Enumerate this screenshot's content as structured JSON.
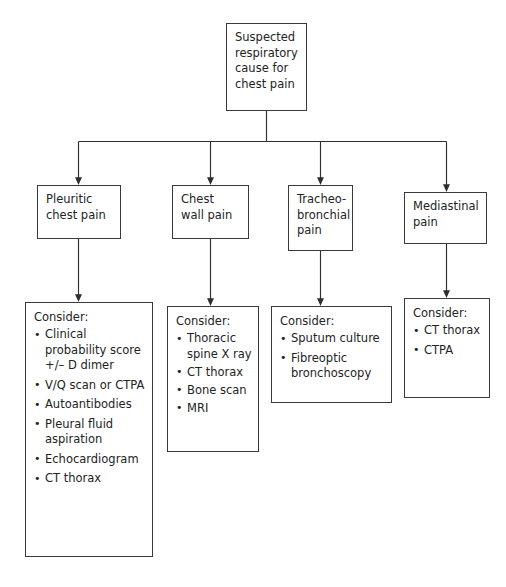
{
  "diagram": {
    "line_color": "#3a3a3a",
    "box_fill": "#ffffff",
    "text_color": "#232323"
  },
  "root": {
    "label": "Suspected\nrespiratory\ncause for\nchest pain"
  },
  "branches": [
    {
      "label": "Pleuritic\nchest pain"
    },
    {
      "label": "Chest\nwall pain"
    },
    {
      "label": "Tracheo-\nbronchial\npain"
    },
    {
      "label": "Mediastinal\npain"
    }
  ],
  "consider_boxes": [
    {
      "header": "Consider:",
      "items": [
        "Clinical\nprobability score\n+/– D dimer",
        "V/Q scan or\nCTPA",
        "Autoantibodies",
        "Pleural fluid\naspiration",
        "Echocardiogram",
        "CT thorax"
      ]
    },
    {
      "header": "Consider:",
      "items": [
        "Thoracic\nspine X ray",
        "CT thorax",
        "Bone scan",
        "MRI"
      ]
    },
    {
      "header": "Consider:",
      "items": [
        "Sputum culture",
        "Fibreoptic\nbronchoscopy"
      ]
    },
    {
      "header": "Consider:",
      "items": [
        "CT thorax",
        "CTPA"
      ]
    }
  ]
}
